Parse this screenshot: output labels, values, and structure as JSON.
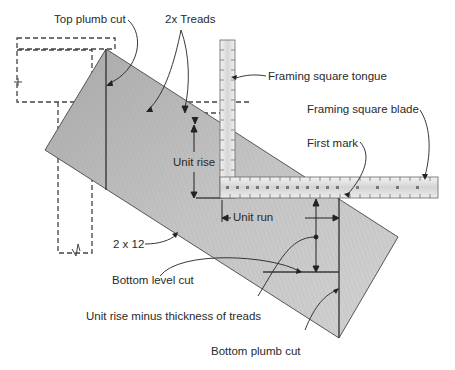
{
  "diagram": {
    "labels": {
      "top_plumb_cut": "Top plumb cut",
      "treads": "2x Treads",
      "tongue": "Framing square tongue",
      "blade": "Framing square blade",
      "first_mark": "First mark",
      "unit_rise": "Unit rise",
      "unit_run": "Unit run",
      "board": "2 x 12",
      "bottom_level_cut": "Bottom level cut",
      "unit_rise_minus": "Unit rise minus thickness of treads",
      "bottom_plumb_cut": "Bottom plumb cut"
    },
    "colors": {
      "board_fill": "#bdbdbd",
      "board_edge": "#555555",
      "line": "#333333",
      "ruler_fill": "#e6e6e6",
      "text": "#2a2a2a"
    },
    "icons": {
      "arrow": "arrowhead-icon",
      "break": "break-symbol-icon"
    }
  }
}
